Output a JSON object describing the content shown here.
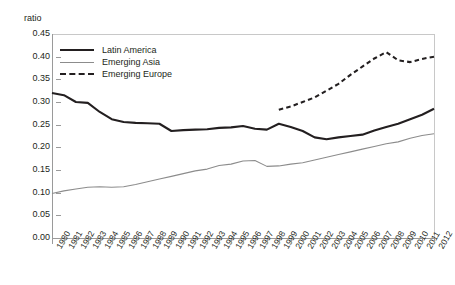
{
  "chart_data": {
    "type": "line",
    "title": "",
    "xlabel": "",
    "ylabel": "ratio",
    "ylim": [
      0.0,
      0.45
    ],
    "ytick_values": [
      0.45,
      0.4,
      0.35,
      0.3,
      0.25,
      0.2,
      0.15,
      0.1,
      0.05,
      0.0
    ],
    "ytick_labels": [
      "0.45",
      "0.40",
      "0.35",
      "0.30",
      "0.25",
      "0.20",
      "0.15",
      "0.10",
      "0.05",
      "0.00"
    ],
    "grid": false,
    "legend_position": "top-left",
    "categories": [
      "1980",
      "1981",
      "1982",
      "1983",
      "1984",
      "1985",
      "1986",
      "1987",
      "1988",
      "1989",
      "1990",
      "1991",
      "1992",
      "1993",
      "1994",
      "1995",
      "1996",
      "1997",
      "1998",
      "1999",
      "2000",
      "2001",
      "2002",
      "2003",
      "2004",
      "2005",
      "2006",
      "2007",
      "2008",
      "2009",
      "2010",
      "2011",
      "2012"
    ],
    "series": [
      {
        "name": "Latin America",
        "style": "solid-thick",
        "color": "#231f20",
        "values": [
          0.32,
          0.315,
          0.3,
          0.298,
          0.278,
          0.262,
          0.256,
          0.254,
          0.253,
          0.252,
          0.236,
          0.238,
          0.239,
          0.24,
          0.243,
          0.244,
          0.247,
          0.241,
          0.239,
          0.252,
          0.245,
          0.236,
          0.222,
          0.218,
          0.222,
          0.225,
          0.228,
          0.237,
          0.245,
          0.252,
          0.262,
          0.272,
          0.285
        ]
      },
      {
        "name": "Emerging Asia",
        "style": "solid-thin",
        "color": "#8c8c8c",
        "values": [
          0.098,
          0.104,
          0.108,
          0.112,
          0.113,
          0.112,
          0.113,
          0.118,
          0.124,
          0.13,
          0.136,
          0.142,
          0.148,
          0.152,
          0.16,
          0.163,
          0.17,
          0.171,
          0.158,
          0.159,
          0.163,
          0.166,
          0.172,
          0.178,
          0.184,
          0.19,
          0.196,
          0.202,
          0.208,
          0.212,
          0.22,
          0.226,
          0.23
        ]
      },
      {
        "name": "Emerging Europe",
        "style": "dashed",
        "color": "#231f20",
        "start_year": "1999",
        "values": [
          null,
          null,
          null,
          null,
          null,
          null,
          null,
          null,
          null,
          null,
          null,
          null,
          null,
          null,
          null,
          null,
          null,
          null,
          null,
          0.283,
          0.29,
          0.3,
          0.31,
          0.325,
          0.34,
          0.36,
          0.378,
          0.396,
          0.41,
          0.392,
          0.388,
          0.395,
          0.4
        ]
      }
    ]
  },
  "legend": {
    "items": [
      {
        "label": "Latin America"
      },
      {
        "label": "Emerging Asia"
      },
      {
        "label": "Emerging Europe"
      }
    ]
  },
  "axis": {
    "y_title": "ratio"
  }
}
